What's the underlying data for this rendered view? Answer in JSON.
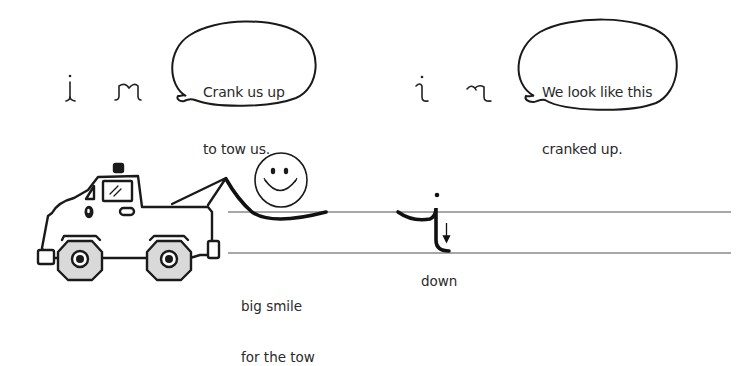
{
  "bubbles": [
    {
      "text_line1": "Crank us up",
      "text_line2": "to tow us."
    },
    {
      "text_line1": "We look like this",
      "text_line2": "cranked up."
    }
  ],
  "labels": {
    "smile_line1": "big smile",
    "smile_line2": "for the tow",
    "down": "down"
  },
  "glyphs": {
    "uncranked": [
      "i",
      "m"
    ],
    "cranked": [
      "i",
      "m"
    ]
  },
  "icons": {
    "truck": "tow-truck-illustration",
    "smiley": "smiley-face",
    "arrow": "down-arrow"
  },
  "colors": {
    "ink": "#1a1a1a",
    "guide_line": "#8a8a8a",
    "wheel_fill": "#d9d9d9",
    "background": "#ffffff"
  }
}
